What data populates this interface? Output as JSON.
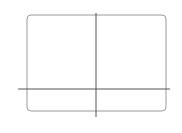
{
  "chart_data": {
    "type": "line",
    "title": "",
    "xlabel": "",
    "ylabel": "",
    "xlim": [
      -3,
      3
    ],
    "ylim": [
      -5,
      15
    ],
    "x_tick_labels": [
      "-3",
      "3"
    ],
    "y_tick_labels": [
      "15",
      "-5"
    ],
    "x_ticks": [
      -2,
      -1,
      1,
      2
    ],
    "y_ticks": [
      5,
      10
    ],
    "grid": false,
    "series": [
      {
        "name": "f(x)",
        "x": [
          -3.0,
          -2.75,
          -2.5,
          -2.25,
          -2.0,
          -1.75,
          -1.5,
          -1.25,
          -1.0,
          -0.75,
          -0.5,
          -0.25,
          0.0,
          0.25,
          0.5,
          0.75,
          1.0,
          1.25,
          1.5,
          1.75,
          2.0,
          2.25,
          2.5,
          2.75,
          3.0
        ],
        "values": [
          -6.0,
          -0.05,
          2.88,
          5.86,
          8.0,
          9.39,
          10.13,
          10.3,
          10.0,
          9.33,
          8.38,
          7.23,
          6.0,
          4.77,
          3.63,
          4.67,
          2.0,
          1.7,
          1.88,
          2.61,
          4.0,
          6.14,
          9.13,
          13.05,
          18.0
        ]
      }
    ]
  },
  "labels": {
    "y_max": "15",
    "y_min": "−5",
    "x_min": "−3",
    "x_max": "3"
  },
  "colors": {
    "frame": "#9a9a9a",
    "axis": "#555555",
    "curve": "#6a6a6a"
  }
}
